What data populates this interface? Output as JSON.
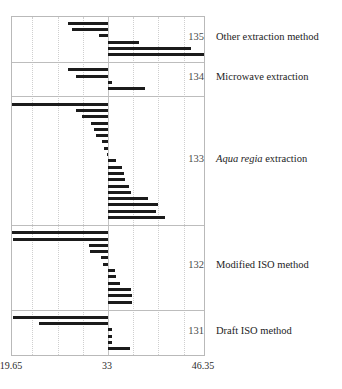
{
  "chart_data": {
    "type": "bar",
    "title": "",
    "subtitle": "",
    "xlabel": "",
    "ylabel": "",
    "orientation": "horizontal",
    "grid": true,
    "legend_position": "right-labels",
    "xlim": [
      19.65,
      46.35
    ],
    "reference_value": 33,
    "xticks": [
      {
        "value": 19.65,
        "label": "19.65"
      },
      {
        "value": 33,
        "label": "33"
      },
      {
        "value": 46.35,
        "label": "46.35"
      }
    ],
    "gridlines": [
      22.5,
      26.0,
      29.5,
      33.0,
      36.5,
      40.0,
      43.5
    ],
    "groups": [
      {
        "id": "135",
        "number_label": "135",
        "name": "Other extraction method",
        "italic_prefix": "",
        "bars": [
          {
            "start": 33.0,
            "end": 27.5
          },
          {
            "start": 33.0,
            "end": 28.0
          },
          {
            "start": 33.0,
            "end": 31.8
          },
          {
            "start": 33.0,
            "end": 37.3
          },
          {
            "start": 33.0,
            "end": 44.5
          },
          {
            "start": 33.0,
            "end": 46.3
          }
        ]
      },
      {
        "id": "134",
        "number_label": "134",
        "name": "Microwave extraction",
        "italic_prefix": "",
        "bars": [
          {
            "start": 33.0,
            "end": 27.4
          },
          {
            "start": 33.0,
            "end": 28.5
          },
          {
            "start": 33.0,
            "end": 33.5
          },
          {
            "start": 33.0,
            "end": 38.1
          }
        ]
      },
      {
        "id": "133",
        "number_label": "133",
        "name": "extraction",
        "italic_prefix": "Aqua regia",
        "bars": [
          {
            "start": 33.0,
            "end": 19.7
          },
          {
            "start": 33.0,
            "end": 28.6
          },
          {
            "start": 33.0,
            "end": 29.4
          },
          {
            "start": 33.0,
            "end": 30.6
          },
          {
            "start": 33.0,
            "end": 31.1
          },
          {
            "start": 33.0,
            "end": 31.3
          },
          {
            "start": 33.0,
            "end": 32.2
          },
          {
            "start": 33.0,
            "end": 32.5
          },
          {
            "start": 33.0,
            "end": 32.8
          },
          {
            "start": 33.0,
            "end": 34.1
          },
          {
            "start": 33.0,
            "end": 35.0
          },
          {
            "start": 33.0,
            "end": 35.2
          },
          {
            "start": 33.0,
            "end": 35.3
          },
          {
            "start": 33.0,
            "end": 35.9
          },
          {
            "start": 33.0,
            "end": 36.2
          },
          {
            "start": 33.0,
            "end": 38.5
          },
          {
            "start": 33.0,
            "end": 39.9
          },
          {
            "start": 33.0,
            "end": 39.7
          },
          {
            "start": 33.0,
            "end": 40.9
          }
        ]
      },
      {
        "id": "132",
        "number_label": "132",
        "name": "Modified ISO method",
        "italic_prefix": "",
        "bars": [
          {
            "start": 33.0,
            "end": 19.7
          },
          {
            "start": 33.0,
            "end": 19.8
          },
          {
            "start": 33.0,
            "end": 30.3
          },
          {
            "start": 33.0,
            "end": 30.5
          },
          {
            "start": 33.0,
            "end": 32.0
          },
          {
            "start": 33.0,
            "end": 32.3
          },
          {
            "start": 33.0,
            "end": 34.0
          },
          {
            "start": 33.0,
            "end": 34.1
          },
          {
            "start": 33.0,
            "end": 34.6
          },
          {
            "start": 33.0,
            "end": 36.2
          },
          {
            "start": 33.0,
            "end": 36.3
          },
          {
            "start": 33.0,
            "end": 36.3
          }
        ]
      },
      {
        "id": "131",
        "number_label": "131",
        "name": "Draft ISO method",
        "italic_prefix": "",
        "bars": [
          {
            "start": 33.0,
            "end": 19.8
          },
          {
            "start": 33.0,
            "end": 23.4
          },
          {
            "start": 33.0,
            "end": 33.5
          },
          {
            "start": 33.0,
            "end": 33.6
          },
          {
            "start": 33.0,
            "end": 33.6
          },
          {
            "start": 33.0,
            "end": 36.0
          }
        ]
      }
    ],
    "colors": {
      "bar": "#1b1b1b",
      "gridline": "#cfcfcf",
      "frame": "#b9b9b9",
      "text": "#1c1c1c",
      "group_number": "#4a4a4a"
    }
  }
}
